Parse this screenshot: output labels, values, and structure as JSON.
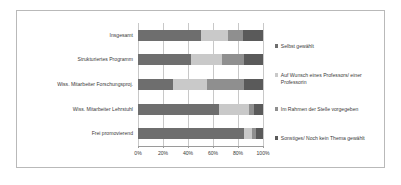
{
  "chart_data": {
    "type": "bar",
    "orientation": "horizontal",
    "stacked": true,
    "normalized": true,
    "title": "",
    "xlabel": "",
    "ylabel": "",
    "xlim": [
      0,
      100
    ],
    "grid": true,
    "legend_position": "right",
    "xticks": [
      "0%",
      "20%",
      "40%",
      "60%",
      "80%",
      "100%"
    ],
    "xtick_values": [
      0,
      20,
      40,
      60,
      80,
      100
    ],
    "categories": [
      "Insgesamt",
      "Strukturiertes Programm",
      "Wiss. Mitarbeiter Forschungsproj.",
      "Wiss. Mitarbeiter Lehrstuhl",
      "Frei promovierend"
    ],
    "series": [
      {
        "name": "Selbst gewählt",
        "color": "#6e6e6e",
        "values": [
          50,
          42,
          28,
          65,
          85
        ]
      },
      {
        "name": "Auf Wunsch eines Professors/ einer Professorin",
        "color": "#c9c9c9",
        "values": [
          22,
          25,
          27,
          24,
          6
        ]
      },
      {
        "name": "Im Rahmen der Stelle vorgegeben",
        "color": "#8f8f8f",
        "values": [
          12,
          18,
          30,
          4,
          3
        ]
      },
      {
        "name": "Sonstiges/ Noch kein Thema gewählt",
        "color": "#5a5a5a",
        "values": [
          16,
          15,
          15,
          7,
          6
        ]
      }
    ]
  },
  "legend": {
    "items": [
      {
        "label": "Selbst gewählt",
        "color": "#6e6e6e",
        "top": 18
      },
      {
        "label": "Auf Wunsch eines Professors/ einer Professorin",
        "color": "#c9c9c9",
        "top": 47
      },
      {
        "label": "Im Rahmen der Stelle vorgegeben",
        "color": "#8f8f8f",
        "top": 81
      },
      {
        "label": "Sonstiges/ Noch kein Thema gewählt",
        "color": "#5a5a5a",
        "top": 110
      }
    ]
  }
}
